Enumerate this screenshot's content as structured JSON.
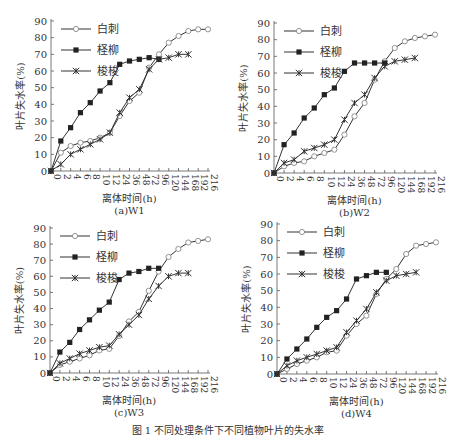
{
  "figure": {
    "caption": "图 1  不同处理条件下不同植物叶片的失水率"
  },
  "chart_data": [
    {
      "type": "line",
      "panel_label": "(a)W1",
      "xlabel": "离体时间(h)",
      "ylabel": "叶片失水率(%)",
      "ylim": [
        0,
        90
      ],
      "yticks": [
        0,
        10,
        20,
        30,
        40,
        50,
        60,
        70,
        80,
        90
      ],
      "categories": [
        "0",
        "2",
        "4",
        "6",
        "8",
        "10",
        "12",
        "24",
        "36",
        "48",
        "72",
        "96",
        "120",
        "144",
        "168",
        "192",
        "216"
      ],
      "legend_position": "upper-left",
      "grid": false,
      "series": [
        {
          "name": "白刺",
          "marker": "open-circle",
          "values": [
            0,
            11,
            15,
            17,
            18,
            20,
            23,
            33,
            42,
            47,
            62,
            70,
            77,
            81,
            84,
            85,
            85
          ]
        },
        {
          "name": "柽柳",
          "marker": "filled-square",
          "values": [
            0,
            18,
            26,
            35,
            41,
            48,
            53,
            64,
            66,
            67,
            68,
            67
          ]
        },
        {
          "name": "梭梭",
          "marker": "asterisk",
          "values": [
            0,
            4,
            10,
            13,
            16,
            19,
            23,
            35,
            44,
            49,
            61,
            67,
            68,
            70,
            70
          ]
        }
      ]
    },
    {
      "type": "line",
      "panel_label": "(b)W2",
      "xlabel": "离体时间(h)",
      "ylabel": "叶片失水率(%)",
      "ylim": [
        0,
        90
      ],
      "yticks": [
        0,
        10,
        20,
        30,
        40,
        50,
        60,
        70,
        80,
        90
      ],
      "categories": [
        "0",
        "2",
        "4",
        "6",
        "8",
        "10",
        "12",
        "24",
        "36",
        "48",
        "72",
        "96",
        "120",
        "144",
        "168",
        "192",
        "216"
      ],
      "legend_position": "upper-left",
      "grid": false,
      "series": [
        {
          "name": "白刺",
          "marker": "open-circle",
          "values": [
            0,
            4,
            6,
            7,
            10,
            12,
            14,
            23,
            34,
            42,
            56,
            67,
            75,
            79,
            81,
            82,
            83
          ]
        },
        {
          "name": "柽柳",
          "marker": "filled-square",
          "values": [
            0,
            17,
            24,
            33,
            39,
            47,
            51,
            61,
            66,
            66,
            66,
            66
          ]
        },
        {
          "name": "梭梭",
          "marker": "asterisk",
          "values": [
            0,
            6,
            8,
            13,
            15,
            17,
            20,
            32,
            42,
            47,
            57,
            64,
            67,
            68,
            69
          ]
        }
      ]
    },
    {
      "type": "line",
      "panel_label": "(c)W3",
      "xlabel": "离体时间(h)",
      "ylabel": "叶片失水率(%)",
      "ylim": [
        0,
        90
      ],
      "yticks": [
        0,
        10,
        20,
        30,
        40,
        50,
        60,
        70,
        80,
        90
      ],
      "categories": [
        "0",
        "2",
        "4",
        "6",
        "8",
        "10",
        "12",
        "24",
        "36",
        "48",
        "72",
        "96",
        "120",
        "144",
        "168",
        "192",
        "216"
      ],
      "legend_position": "upper-left",
      "grid": false,
      "series": [
        {
          "name": "白刺",
          "marker": "open-circle",
          "values": [
            0,
            5,
            7,
            9,
            11,
            14,
            15,
            23,
            32,
            38,
            51,
            63,
            72,
            77,
            81,
            82,
            83
          ]
        },
        {
          "name": "柽柳",
          "marker": "filled-square",
          "values": [
            0,
            13,
            19,
            27,
            33,
            39,
            44,
            58,
            62,
            63,
            65,
            65
          ]
        },
        {
          "name": "梭梭",
          "marker": "asterisk",
          "values": [
            0,
            6,
            9,
            12,
            14,
            16,
            17,
            24,
            30,
            36,
            46,
            54,
            60,
            62,
            62
          ]
        }
      ]
    },
    {
      "type": "line",
      "panel_label": "(d)W4",
      "xlabel": "离体时间(h)",
      "ylabel": "叶片失水率(%)",
      "ylim": [
        0,
        90
      ],
      "yticks": [
        0,
        10,
        20,
        30,
        40,
        50,
        60,
        70,
        80,
        90
      ],
      "categories": [
        "0",
        "2",
        "4",
        "6",
        "8",
        "10",
        "12",
        "24",
        "36",
        "48",
        "72",
        "96",
        "120",
        "144",
        "168",
        "192",
        "216"
      ],
      "legend_position": "upper-left",
      "grid": false,
      "series": [
        {
          "name": "白刺",
          "marker": "open-circle",
          "values": [
            0,
            3,
            6,
            8,
            10,
            13,
            14,
            23,
            30,
            35,
            48,
            57,
            63,
            72,
            77,
            78,
            79
          ]
        },
        {
          "name": "柽柳",
          "marker": "filled-square",
          "values": [
            0,
            9,
            15,
            21,
            28,
            34,
            38,
            45,
            57,
            59,
            61,
            61
          ]
        },
        {
          "name": "梭梭",
          "marker": "asterisk",
          "values": [
            0,
            5,
            8,
            10,
            12,
            14,
            16,
            25,
            32,
            39,
            49,
            56,
            59,
            60,
            61
          ]
        }
      ]
    }
  ],
  "layout": {
    "panels": [
      {
        "x0": 51,
        "x1": 208,
        "yTop": 21,
        "yBottom": 171
      },
      {
        "x0": 274,
        "x1": 435,
        "yTop": 23,
        "yBottom": 173
      },
      {
        "x0": 50,
        "x1": 208,
        "yTop": 228,
        "yBottom": 373
      },
      {
        "x0": 277,
        "x1": 436,
        "yTop": 224,
        "yBottom": 374
      }
    ],
    "colors": {
      "axis": "#555555",
      "line": "#333333",
      "marker_fill": "#222222",
      "open_fill": "#ffffff",
      "open_stroke": "#888888"
    }
  }
}
